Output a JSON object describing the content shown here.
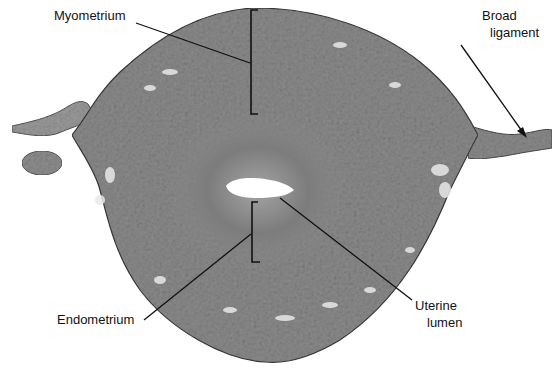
{
  "figure": {
    "background_color": "#ffffff",
    "tissue_color": "#8a8a8a",
    "inner_zone_color": "#7a7a7a",
    "lumen_color": "#ffffff",
    "line_color": "#111111"
  },
  "labels": {
    "myometrium": "Myometrium",
    "broad_ligament_line1": "Broad",
    "broad_ligament_line2": "ligament",
    "endometrium": "Endometrium",
    "uterine_lumen_line1": "Uterine",
    "uterine_lumen_line2": "lumen"
  }
}
